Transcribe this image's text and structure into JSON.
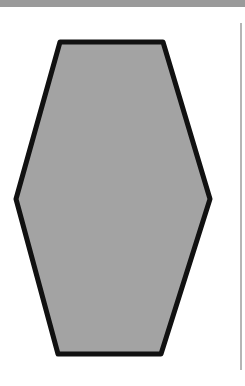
{
  "shape": {
    "type": "hexagon",
    "fill": "#a3a3a3",
    "stroke": "#111111",
    "stroke_width": 5,
    "points": "60,42 163,42 210,199 161,354 58,354 16,199"
  },
  "colors": {
    "top_bar": "#9a9a9a",
    "divider": "#b5b5b5",
    "background": "#ffffff"
  }
}
